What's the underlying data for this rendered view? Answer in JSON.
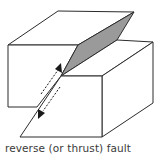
{
  "diagram": {
    "title": "reverse (or thrust) fault",
    "caption": "reverse (or thrust) fault",
    "colors": {
      "line": "#2b2b2b",
      "fault_plane": "#9a9a9a",
      "block_face": "#ffffff",
      "arrow": "#1a1a1a",
      "text": "#3a3a3a"
    },
    "elements": [
      {
        "id": "hanging-wall-block",
        "description": "left block (raised)"
      },
      {
        "id": "footwall-block",
        "description": "right block (lower)"
      },
      {
        "id": "fault-plane",
        "description": "exposed gray fault surface"
      },
      {
        "id": "motion-arrow-up",
        "description": "dashed arrow pointing up along fault"
      },
      {
        "id": "motion-arrow-down",
        "description": "dashed arrow pointing down along fault"
      }
    ]
  }
}
